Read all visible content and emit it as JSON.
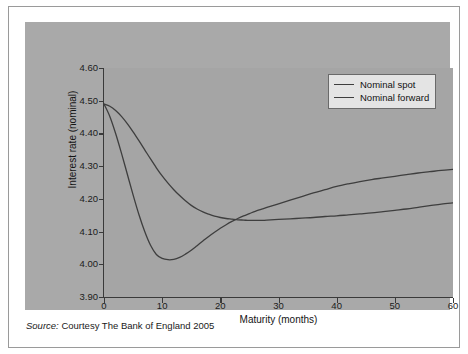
{
  "figure": {
    "source_prefix": "Source:",
    "source_text": "Courtesy The Bank of England 2005"
  },
  "chart_data": {
    "type": "line",
    "title": "",
    "xlabel": "Maturity (months)",
    "ylabel": "Interest rate (nominal)",
    "xlim": [
      0,
      60
    ],
    "ylim": [
      3.9,
      4.6
    ],
    "xticks": [
      0,
      10,
      20,
      30,
      40,
      50,
      60
    ],
    "xtick_labels": [
      "0",
      "10",
      "20",
      "30",
      "40",
      "50",
      "60"
    ],
    "yticks": [
      3.9,
      4.0,
      4.1,
      4.2,
      4.3,
      4.4,
      4.5,
      4.6
    ],
    "ytick_labels": [
      "3.90",
      "4.00",
      "4.10",
      "4.20",
      "4.30",
      "4.40",
      "4.50",
      "4.60"
    ],
    "grid": false,
    "legend_position": "top-right",
    "line_color": "#3e3e3e",
    "plot_background": "#a5a5a5",
    "panel_background": "#a9a9a9",
    "series": [
      {
        "name": "Nominal spot",
        "color": "#3e3e3e",
        "x": [
          0,
          1,
          2,
          3,
          4,
          5,
          6,
          7,
          8,
          9,
          10,
          11,
          12,
          13,
          14,
          15,
          16,
          17,
          18,
          19,
          20,
          21,
          22,
          23,
          24,
          25,
          26,
          27,
          28,
          30,
          32,
          34,
          36,
          38,
          40,
          42,
          44,
          46,
          48,
          50,
          52,
          54,
          56,
          58,
          60
        ],
        "values": [
          4.49,
          4.483,
          4.47,
          4.452,
          4.43,
          4.405,
          4.378,
          4.35,
          4.322,
          4.295,
          4.27,
          4.248,
          4.228,
          4.21,
          4.194,
          4.18,
          4.169,
          4.16,
          4.153,
          4.147,
          4.143,
          4.14,
          4.138,
          4.136,
          4.135,
          4.134,
          4.134,
          4.134,
          4.135,
          4.137,
          4.139,
          4.141,
          4.143,
          4.146,
          4.148,
          4.151,
          4.154,
          4.157,
          4.161,
          4.165,
          4.169,
          4.174,
          4.179,
          4.184,
          4.188
        ]
      },
      {
        "name": "Nominal forward",
        "color": "#3e3e3e",
        "x": [
          0,
          1,
          2,
          3,
          4,
          5,
          6,
          7,
          8,
          9,
          10,
          11,
          12,
          13,
          14,
          15,
          16,
          17,
          18,
          19,
          20,
          21,
          22,
          23,
          24,
          25,
          26,
          27,
          28,
          30,
          32,
          34,
          36,
          38,
          40,
          42,
          44,
          46,
          48,
          50,
          52,
          54,
          56,
          58,
          60
        ],
        "values": [
          4.49,
          4.452,
          4.4,
          4.34,
          4.276,
          4.212,
          4.152,
          4.1,
          4.058,
          4.03,
          4.018,
          4.014,
          4.015,
          4.021,
          4.031,
          4.043,
          4.057,
          4.071,
          4.085,
          4.098,
          4.11,
          4.121,
          4.131,
          4.14,
          4.148,
          4.155,
          4.162,
          4.168,
          4.174,
          4.185,
          4.196,
          4.207,
          4.218,
          4.228,
          4.238,
          4.246,
          4.253,
          4.259,
          4.264,
          4.269,
          4.274,
          4.279,
          4.283,
          4.287,
          4.29
        ]
      }
    ],
    "annotations": {
      "crossover_month": 26.5,
      "crossover_value": 4.134,
      "forward_trough_month": 11.5,
      "forward_trough_value": 4.014,
      "spot_trough_month": 26,
      "spot_trough_value": 4.134
    }
  },
  "legend": {
    "items": [
      {
        "label": "Nominal spot"
      },
      {
        "label": "Nominal forward"
      }
    ]
  }
}
